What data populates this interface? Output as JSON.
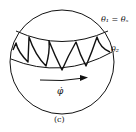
{
  "figure": {
    "caption": "(c)",
    "labels": {
      "theta1": "θ₁ = θₛ",
      "theta2": "θ₂",
      "phi_dot": "φ̇"
    },
    "colors": {
      "stroke": "#111111",
      "background": "#ffffff"
    }
  }
}
